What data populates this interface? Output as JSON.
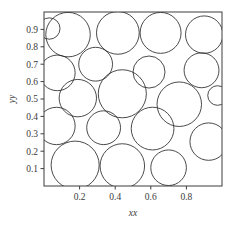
{
  "figure": {
    "width": 236,
    "height": 231,
    "background": "#ffffff",
    "frame_color": "#3d3d3d",
    "circle_stroke": "#2a2a2a",
    "text_color": "#3a3a3a"
  },
  "chart_data": {
    "type": "scatter",
    "title": "",
    "subtitle": "",
    "xlabel": "xx",
    "ylabel": "yy",
    "xlim": [
      0.0,
      1.0
    ],
    "ylim": [
      0.0,
      1.0
    ],
    "xticks": [
      0.2,
      0.4,
      0.6,
      0.8
    ],
    "xticklabels": [
      "0.2",
      "0.4",
      "0.6",
      "0.8"
    ],
    "yticks": [
      0.1,
      0.2,
      0.3,
      0.4,
      0.5,
      0.6,
      0.7,
      0.8,
      0.9
    ],
    "yticklabels": [
      "0.1",
      "0.2",
      "0.3",
      "0.4",
      "0.5",
      "0.6",
      "0.7",
      "0.8",
      "0.9"
    ],
    "grid": false,
    "legend": null,
    "annotations": [],
    "marker": "circle-outline",
    "circle_count": 20,
    "circles": [
      {
        "id": 1,
        "x": 0.135,
        "y": 0.87,
        "r": 0.125
      },
      {
        "id": 2,
        "x": 0.415,
        "y": 0.88,
        "r": 0.12
      },
      {
        "id": 3,
        "x": 0.655,
        "y": 0.88,
        "r": 0.115
      },
      {
        "id": 4,
        "x": 0.9,
        "y": 0.87,
        "r": 0.105
      },
      {
        "id": 5,
        "x": 0.075,
        "y": 0.65,
        "r": 0.1
      },
      {
        "id": 6,
        "x": 0.29,
        "y": 0.7,
        "r": 0.095
      },
      {
        "id": 7,
        "x": 0.59,
        "y": 0.655,
        "r": 0.09
      },
      {
        "id": 8,
        "x": 0.885,
        "y": 0.665,
        "r": 0.098
      },
      {
        "id": 9,
        "x": 0.19,
        "y": 0.505,
        "r": 0.105
      },
      {
        "id": 10,
        "x": 0.44,
        "y": 0.53,
        "r": 0.135
      },
      {
        "id": 11,
        "x": 0.76,
        "y": 0.47,
        "r": 0.125
      },
      {
        "id": 12,
        "x": 0.07,
        "y": 0.345,
        "r": 0.105
      },
      {
        "id": 13,
        "x": 0.335,
        "y": 0.335,
        "r": 0.095
      },
      {
        "id": 14,
        "x": 0.61,
        "y": 0.33,
        "r": 0.12
      },
      {
        "id": 15,
        "x": 0.925,
        "y": 0.255,
        "r": 0.105
      },
      {
        "id": 16,
        "x": 0.175,
        "y": 0.12,
        "r": 0.135
      },
      {
        "id": 17,
        "x": 0.44,
        "y": 0.115,
        "r": 0.125
      },
      {
        "id": 18,
        "x": 0.7,
        "y": 0.105,
        "r": 0.1
      },
      {
        "id": 19,
        "x": 0.03,
        "y": 0.905,
        "r": 0.06
      },
      {
        "id": 20,
        "x": 0.975,
        "y": 0.52,
        "r": 0.055
      }
    ]
  }
}
